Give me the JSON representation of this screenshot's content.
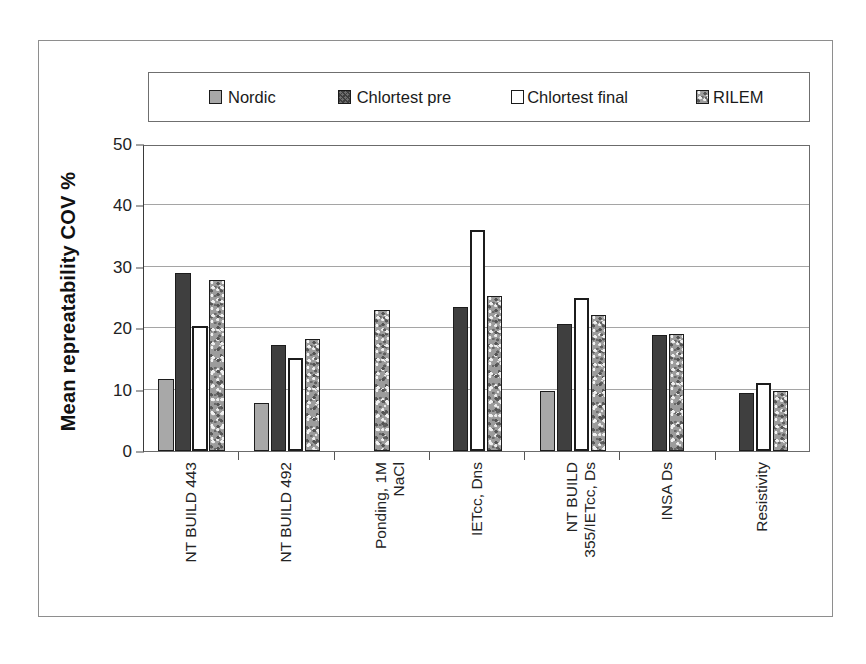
{
  "chart_data": {
    "type": "bar",
    "title": "",
    "xlabel": "",
    "ylabel": "Mean repreatability COV %",
    "ylim": [
      0,
      50
    ],
    "yticks": [
      0,
      10,
      20,
      30,
      40,
      50
    ],
    "grid": true,
    "legend_position": "top",
    "categories": [
      "NT BUILD 443",
      "NT BUILD 492",
      "Ponding, 1M NaCl",
      "IETcc, Dns",
      "NT BUILD 355/IETcc, Ds",
      "INSA Ds",
      "Resistivity"
    ],
    "category_lines": [
      [
        "NT BUILD 443"
      ],
      [
        "NT BUILD 492"
      ],
      [
        "Ponding, 1M",
        "NaCl"
      ],
      [
        "IETcc, Dns"
      ],
      [
        "NT BUILD",
        "355/IETcc, Ds"
      ],
      [
        "INSA Ds"
      ],
      [
        "Resistivity"
      ]
    ],
    "series": [
      {
        "name": "Nordic",
        "color": "#a8a8a8",
        "pattern": "solid-gray",
        "values": [
          11.7,
          7.8,
          null,
          null,
          9.8,
          null,
          null
        ]
      },
      {
        "name": "Chlortest pre",
        "color": "#3f3f3f",
        "pattern": "solid-dark",
        "values": [
          29.0,
          17.2,
          null,
          23.5,
          20.7,
          18.9,
          9.4
        ]
      },
      {
        "name": "Chlortest final",
        "color": "#ffffff",
        "pattern": "outline",
        "values": [
          20.3,
          15.2,
          null,
          36.0,
          25.0,
          null,
          11.0
        ]
      },
      {
        "name": "RILEM",
        "color": "#9c9c9c",
        "pattern": "speckled",
        "values": [
          27.8,
          18.2,
          23.0,
          25.2,
          22.2,
          19.1,
          9.8
        ]
      }
    ]
  },
  "legend": {
    "items": [
      {
        "label": "Nordic",
        "swatch": "swatch-nordic"
      },
      {
        "label": "Chlortest pre",
        "swatch": "swatch-chlortest-pre"
      },
      {
        "label": "Chlortest final",
        "swatch": "swatch-chlortest-final"
      },
      {
        "label": "RILEM",
        "swatch": "swatch-rilem"
      }
    ]
  },
  "axis": {
    "y_title": "Mean repreatability COV %",
    "y_tick_labels": [
      "0",
      "10",
      "20",
      "30",
      "40",
      "50"
    ]
  }
}
